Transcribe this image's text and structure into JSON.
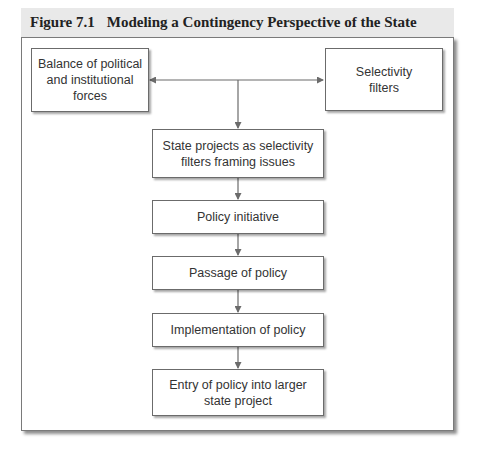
{
  "figure": {
    "number": "Figure 7.1",
    "title": "Modeling a Contingency Perspective of the State"
  },
  "nodes": {
    "balance": {
      "line1": "Balance of political",
      "line2": "and institutional",
      "line3": "forces"
    },
    "selectivity": {
      "line1": "Selectivity",
      "line2": "filters"
    },
    "state_projects": {
      "line1": "State projects as selectivity",
      "line2": "filters framing issues"
    },
    "policy_initiative": {
      "line1": "Policy initiative"
    },
    "passage": {
      "line1": "Passage of policy"
    },
    "implementation": {
      "line1": "Implementation of policy"
    },
    "entry": {
      "line1": "Entry of policy into larger",
      "line2": "state project"
    }
  },
  "edges": [
    {
      "from": "center-junction",
      "to": "balance",
      "type": "arrow-left"
    },
    {
      "from": "center-junction",
      "to": "selectivity",
      "type": "arrow-right"
    },
    {
      "from": "center-junction",
      "to": "state_projects",
      "type": "arrow-down"
    },
    {
      "from": "state_projects",
      "to": "policy_initiative",
      "type": "arrow-down"
    },
    {
      "from": "policy_initiative",
      "to": "passage",
      "type": "arrow-down"
    },
    {
      "from": "passage",
      "to": "implementation",
      "type": "arrow-down"
    },
    {
      "from": "implementation",
      "to": "entry",
      "type": "arrow-down"
    }
  ],
  "colors": {
    "header_bg": "#e9e9e9",
    "line": "#6b6b6b",
    "text": "#333333"
  }
}
